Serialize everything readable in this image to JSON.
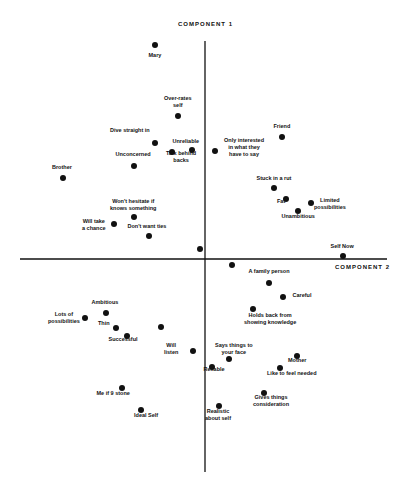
{
  "chart_data": {
    "type": "scatter",
    "title": "",
    "xlabel": "COMPONENT 2",
    "ylabel": "COMPONENT 1",
    "grid": false,
    "legend": null,
    "axes": {
      "origin_px": [
        205,
        259
      ],
      "x_range_px": [
        20,
        387
      ],
      "y_range_px": [
        41,
        472
      ]
    },
    "points": [
      {
        "label": "Mary",
        "x": 155,
        "y": 45,
        "lx": 155,
        "ly": 55,
        "anchor": "center"
      },
      {
        "label": "Over-rates\nself",
        "x": 178,
        "y": 116,
        "lx": 178,
        "ly": 98,
        "anchor": "center"
      },
      {
        "label": "Dive straight in",
        "x": 155,
        "y": 143,
        "lx": 130,
        "ly": 130,
        "anchor": "center"
      },
      {
        "label": "Unreliable",
        "x": 192,
        "y": 150,
        "lx": 186,
        "ly": 141,
        "anchor": "center"
      },
      {
        "label": "Talk behind\nbacks",
        "x": 172,
        "y": 152,
        "lx": 181,
        "ly": 153,
        "anchor": "center"
      },
      {
        "label": "Unconcerned",
        "x": 134,
        "y": 166,
        "lx": 133,
        "ly": 154,
        "anchor": "center"
      },
      {
        "label": "Brother",
        "x": 63,
        "y": 178,
        "lx": 62,
        "ly": 167,
        "anchor": "center"
      },
      {
        "label": "Only interested\nin what they\nhave to say",
        "x": 215,
        "y": 151,
        "lx": 244,
        "ly": 140,
        "anchor": "center"
      },
      {
        "label": "Friend",
        "x": 282,
        "y": 137,
        "lx": 282,
        "ly": 126,
        "anchor": "center"
      },
      {
        "label": "Stuck in a rut",
        "x": 274,
        "y": 188,
        "lx": 274,
        "ly": 178,
        "anchor": "center"
      },
      {
        "label": "Fat",
        "x": 286,
        "y": 199,
        "lx": 281,
        "ly": 201,
        "anchor": "center"
      },
      {
        "label": "Limited\npossibilities",
        "x": 311,
        "y": 203,
        "lx": 330,
        "ly": 200,
        "anchor": "center"
      },
      {
        "label": "Unambitious",
        "x": 298,
        "y": 211,
        "lx": 298,
        "ly": 216,
        "anchor": "center"
      },
      {
        "label": "Won't hesitate if\nknows something",
        "x": 134,
        "y": 217,
        "lx": 133,
        "ly": 201,
        "anchor": "center"
      },
      {
        "label": "Will take\na chance",
        "x": 114,
        "y": 224,
        "lx": 94,
        "ly": 221,
        "anchor": "center"
      },
      {
        "label": "Don't want ties",
        "x": 149,
        "y": 236,
        "lx": 147,
        "ly": 226,
        "anchor": "center"
      },
      {
        "label": "",
        "x": 200,
        "y": 249,
        "lx": 0,
        "ly": 0,
        "anchor": "center"
      },
      {
        "label": "Self Now",
        "x": 343,
        "y": 256,
        "lx": 342,
        "ly": 246,
        "anchor": "center"
      },
      {
        "label": "",
        "x": 232,
        "y": 265,
        "lx": 0,
        "ly": 0,
        "anchor": "center"
      },
      {
        "label": "A family person",
        "x": 269,
        "y": 283,
        "lx": 269,
        "ly": 271,
        "anchor": "center"
      },
      {
        "label": "Careful",
        "x": 283,
        "y": 297,
        "lx": 302,
        "ly": 295,
        "anchor": "center"
      },
      {
        "label": "Holds back from\nshowing knowledge",
        "x": 253,
        "y": 309,
        "lx": 270,
        "ly": 315,
        "anchor": "center"
      },
      {
        "label": "Ambitious",
        "x": 106,
        "y": 313,
        "lx": 105,
        "ly": 302,
        "anchor": "center"
      },
      {
        "label": "Lots of\npossibilities",
        "x": 85,
        "y": 318,
        "lx": 64,
        "ly": 314,
        "anchor": "center"
      },
      {
        "label": "Thin",
        "x": 116,
        "y": 328,
        "lx": 104,
        "ly": 323,
        "anchor": "center"
      },
      {
        "label": "",
        "x": 161,
        "y": 327,
        "lx": 0,
        "ly": 0,
        "anchor": "center"
      },
      {
        "label": "Successful",
        "x": 127,
        "y": 336,
        "lx": 123,
        "ly": 339,
        "anchor": "center"
      },
      {
        "label": "Will\nlisten",
        "x": 193,
        "y": 351,
        "lx": 171,
        "ly": 345,
        "anchor": "center"
      },
      {
        "label": "Says things to\nyour face",
        "x": 229,
        "y": 359,
        "lx": 234,
        "ly": 345,
        "anchor": "center"
      },
      {
        "label": "Mother",
        "x": 297,
        "y": 356,
        "lx": 297,
        "ly": 360,
        "anchor": "center"
      },
      {
        "label": "Reliable",
        "x": 212,
        "y": 367,
        "lx": 214,
        "ly": 369,
        "anchor": "center"
      },
      {
        "label": "Like to feel needed",
        "x": 280,
        "y": 368,
        "lx": 292,
        "ly": 373,
        "anchor": "center"
      },
      {
        "label": "Gives things\nconsideration",
        "x": 264,
        "y": 393,
        "lx": 271,
        "ly": 397,
        "anchor": "center"
      },
      {
        "label": "Me if 9 stone",
        "x": 122,
        "y": 388,
        "lx": 113,
        "ly": 393,
        "anchor": "center"
      },
      {
        "label": "Realistic\nabout self",
        "x": 219,
        "y": 406,
        "lx": 218,
        "ly": 411,
        "anchor": "center"
      },
      {
        "label": "Ideal Self",
        "x": 141,
        "y": 410,
        "lx": 146,
        "ly": 415,
        "anchor": "center"
      }
    ]
  },
  "colors": {
    "background": "#ffffff",
    "ink": "#111111"
  }
}
